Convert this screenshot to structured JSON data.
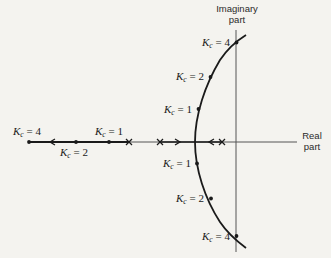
{
  "diagram": {
    "type": "root-locus",
    "axes": {
      "imaginary_label_line1": "Imaginary",
      "imaginary_label_line2": "part",
      "real_label_line1": "Real",
      "real_label_line2": "part"
    },
    "gain_symbol": "K",
    "gain_subscript": "c",
    "labels": {
      "upper_k4": " = 4",
      "upper_k2": " = 2",
      "upper_k1": " = 1",
      "lower_k1": " = 1",
      "lower_k2": " = 2",
      "lower_k4": " = 4",
      "real_k4": " = 4",
      "real_k2": " = 2",
      "real_k1": " = 1"
    },
    "poles": 3,
    "colors": {
      "line": "#1a1a1a",
      "axis": "#555555",
      "background": "#f4f3ef"
    }
  }
}
